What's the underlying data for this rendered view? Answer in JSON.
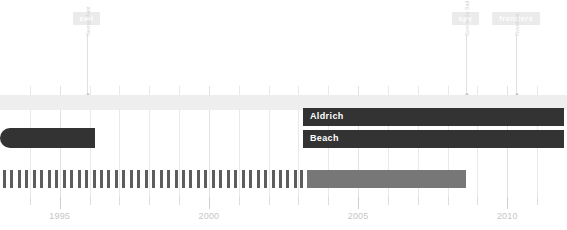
{
  "chart_data": {
    "type": "bar",
    "title": "",
    "xlabel": "",
    "ylabel": "",
    "orientation": "horizontal-timeline",
    "xlim": [
      1993.0,
      2012.0
    ],
    "grid": true,
    "legend": null,
    "axis": {
      "tick_labels": [
        "1995",
        "2000",
        "2005",
        "2010"
      ],
      "tick_values": [
        1995,
        2000,
        2005,
        2010
      ],
      "minor_tick_values": [
        1994,
        1996,
        1997,
        1998,
        1999,
        2001,
        2002,
        2003,
        2004,
        2006,
        2007,
        2008,
        2009,
        2011
      ]
    },
    "eras": [
      {
        "label": "emi",
        "x": 1995.9
      },
      {
        "label": "spy",
        "x": 2008.6
      },
      {
        "label": "frontiers",
        "x": 2010.3
      }
    ],
    "markers": [
      {
        "label": "Nextep Plant",
        "x": 1995.9
      },
      {
        "label": "Govt to Be Bad",
        "x": 2008.6
      },
      {
        "label": "Fivermost",
        "x": 2010.3
      }
    ],
    "series": [
      {
        "name": "background-span",
        "style": "band",
        "start": 1993.0,
        "end": 2012.0,
        "color": "#eeeeee",
        "label": ""
      },
      {
        "name": "Aldrich",
        "style": "bar-dark",
        "start": 2003.15,
        "end": 2011.9,
        "color": "#333333",
        "label": "Aldrich"
      },
      {
        "name": "Beach",
        "style": "bar-dark",
        "start": 2003.15,
        "end": 2011.9,
        "color": "#333333",
        "label": "Beach"
      },
      {
        "name": "early-span",
        "style": "bar-dark",
        "start": 1993.0,
        "end": 1996.2,
        "color": "#333333",
        "label": ""
      },
      {
        "name": "mid-span",
        "style": "bar-mid",
        "start": 2003.3,
        "end": 2008.6,
        "color": "#777777",
        "label": ""
      }
    ],
    "event_ticks": {
      "name": "discrete-events",
      "color": "#5d5d5d",
      "x": [
        1993.1,
        1993.35,
        1993.6,
        1993.85,
        1994.1,
        1994.35,
        1994.6,
        1994.85,
        1995.1,
        1995.35,
        1995.6,
        1995.85,
        1996.1,
        1996.35,
        1996.6,
        1996.85,
        1997.1,
        1997.35,
        1997.6,
        1997.85,
        1998.1,
        1998.35,
        1998.6,
        1998.85,
        1999.1,
        1999.35,
        1999.6,
        1999.85,
        2000.1,
        2000.35,
        2000.6,
        2000.85,
        2001.1,
        2001.35,
        2001.6,
        2001.85,
        2002.1,
        2002.35,
        2002.6,
        2002.85,
        2003.05
      ]
    }
  }
}
